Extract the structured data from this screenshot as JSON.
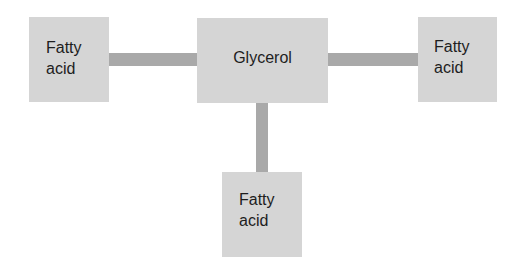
{
  "diagram": {
    "title": "",
    "nodes": [
      {
        "id": "glycerol",
        "label": "Glycerol"
      },
      {
        "id": "fatty_acid_left",
        "label": "Fatty\nacid"
      },
      {
        "id": "fatty_acid_right",
        "label": "Fatty\nacid"
      },
      {
        "id": "fatty_acid_bottom",
        "label": "Fatty\nacid"
      }
    ],
    "edges": [
      {
        "from": "glycerol",
        "to": "fatty_acid_left"
      },
      {
        "from": "glycerol",
        "to": "fatty_acid_right"
      },
      {
        "from": "glycerol",
        "to": "fatty_acid_bottom"
      }
    ],
    "colors": {
      "box": "#d5d5d5",
      "connector": "#a9a9a9",
      "text": "#1e1e1e"
    }
  }
}
